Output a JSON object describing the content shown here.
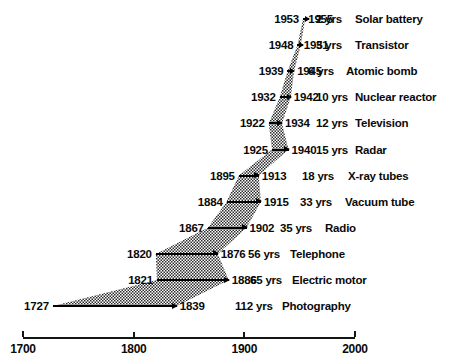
{
  "chart_data": {
    "type": "bar",
    "title": "",
    "subtitle": "",
    "xlabel": "",
    "ylabel": "",
    "xlim": [
      1700,
      2000
    ],
    "grid": false,
    "legend": null,
    "orientation": "horizontal",
    "note": "Gantt-style timeline of the lag between scientific discovery and commercial application for twelve inventions; each bar spans from the discovery year to the application year, annotated with the lag in years.",
    "columns": [
      "discovery_year",
      "application_year",
      "lag",
      "invention"
    ],
    "categories": [
      "Solar battery",
      "Transistor",
      "Atomic bomb",
      "Nuclear reactor",
      "Television",
      "Radar",
      "X-ray tubes",
      "Vacuum tube",
      "Radio",
      "Telephone",
      "Electric motor",
      "Photography"
    ],
    "values": [
      2,
      3,
      6,
      10,
      12,
      15,
      18,
      33,
      35,
      56,
      65,
      112
    ],
    "x_start": [
      1953,
      1948,
      1939,
      1932,
      1922,
      1925,
      1895,
      1884,
      1867,
      1820,
      1821,
      1727
    ],
    "x_end": [
      1955,
      1951,
      1945,
      1942,
      1934,
      1940,
      1913,
      1915,
      1902,
      1876,
      1886,
      1839
    ],
    "axis": {
      "ticks": [
        1700,
        1800,
        1900,
        2000
      ],
      "tick_labels": [
        "1700",
        "1800",
        "1900",
        "2000"
      ]
    }
  },
  "rows": [
    {
      "start": "1953",
      "end": "1955",
      "lag": "2 yrs",
      "invention": "Solar battery"
    },
    {
      "start": "1948",
      "end": "1951",
      "lag": "3 yrs",
      "invention": "Transistor"
    },
    {
      "start": "1939",
      "end": "1945",
      "lag": "6 yrs",
      "invention": "Atomic bomb"
    },
    {
      "start": "1932",
      "end": "1942",
      "lag": "10 yrs",
      "invention": "Nuclear reactor"
    },
    {
      "start": "1922",
      "end": "1934",
      "lag": "12 yrs",
      "invention": "Television"
    },
    {
      "start": "1925",
      "end": "1940",
      "lag": "15 yrs",
      "invention": "Radar"
    },
    {
      "start": "1895",
      "end": "1913",
      "lag": "18 yrs",
      "invention": "X-ray tubes"
    },
    {
      "start": "1884",
      "end": "1915",
      "lag": "33 yrs",
      "invention": "Vacuum tube"
    },
    {
      "start": "1867",
      "end": "1902",
      "lag": "35 yrs",
      "invention": "Radio"
    },
    {
      "start": "1820",
      "end": "1876",
      "lag": "56 yrs",
      "invention": "Telephone"
    },
    {
      "start": "1821",
      "end": "1886",
      "lag": "65 yrs",
      "invention": "Electric motor"
    },
    {
      "start": "1727",
      "end": "1839",
      "lag": "112 yrs",
      "invention": "Photography"
    }
  ],
  "axis": {
    "labels": [
      "1700",
      "1800",
      "1900",
      "2000"
    ]
  },
  "colors": {
    "ink": "#0a0a0a",
    "axis": "#151515",
    "band": "#4d4d4d",
    "background": "#ffffff"
  }
}
